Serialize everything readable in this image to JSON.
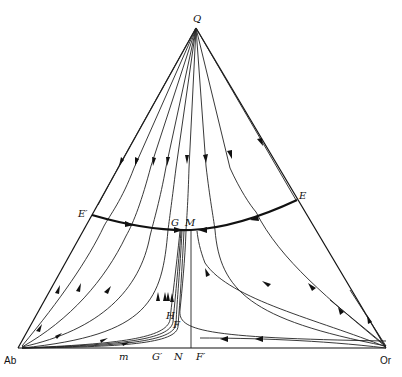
{
  "diagram": {
    "type": "ternary phase diagram with crystallization paths",
    "vertices": {
      "top": {
        "label": "Q",
        "x": 196,
        "y": 28
      },
      "left": {
        "label": "Ab",
        "x": 18,
        "y": 348
      },
      "right": {
        "label": "Or",
        "x": 386,
        "y": 348
      }
    },
    "points": {
      "E_prime": {
        "label": "E′",
        "x": 92,
        "y": 215
      },
      "E": {
        "label": "E",
        "x": 297,
        "y": 201
      },
      "G": {
        "label": "G",
        "x": 178,
        "y": 230
      },
      "M": {
        "label": "M",
        "x": 191,
        "y": 231
      },
      "H": {
        "label": "H",
        "x": 170,
        "y": 318
      },
      "F": {
        "label": "F",
        "x": 176,
        "y": 325
      }
    },
    "base_labels": {
      "m": {
        "label": "m",
        "x": 122
      },
      "G_prime": {
        "label": "G′",
        "x": 155
      },
      "N": {
        "label": "N",
        "x": 177
      },
      "F_prime": {
        "label": "F′",
        "x": 200
      }
    },
    "boundary_curve": {
      "name": "cotectic / field boundary",
      "from": "E′",
      "through": [
        "G",
        "M"
      ],
      "to": "E",
      "arrows": "toward M from both sides"
    },
    "vertical_line": {
      "from": "M",
      "to": "N"
    }
  }
}
